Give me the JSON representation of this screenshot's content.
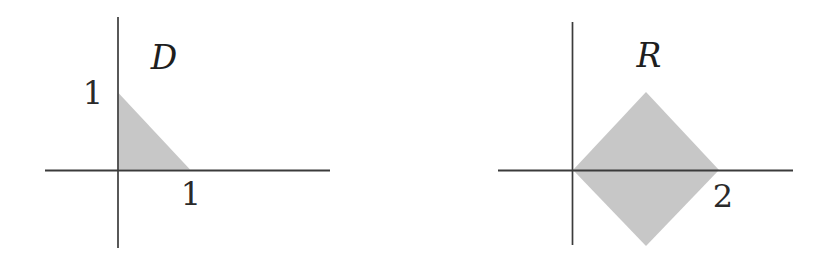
{
  "figure": {
    "colors": {
      "region_fill": "#c7c7c7",
      "axis": "#3b3b3b",
      "text": "#1e1e1e"
    },
    "left": {
      "shape": "triangle",
      "region_label": "D",
      "y_axis_tick_label": "1",
      "x_axis_tick_label": "1"
    },
    "right": {
      "shape": "diamond",
      "region_label": "R",
      "x_axis_tick_label": "2"
    }
  }
}
